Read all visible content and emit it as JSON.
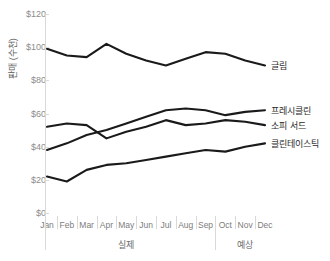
{
  "chart_data": {
    "type": "line",
    "title": "",
    "xlabel": "",
    "ylabel": "판매 (수천)",
    "ylim": [
      0,
      120
    ],
    "ytick_labels": [
      "$0",
      "$20",
      "$40",
      "$60",
      "$80",
      "$100",
      "$120"
    ],
    "ytick_values": [
      0,
      20,
      40,
      60,
      80,
      100,
      120
    ],
    "grid": false,
    "legend_position": "right-inline",
    "categories": [
      "Jan",
      "Feb",
      "Mar",
      "Apr",
      "May",
      "Jun",
      "Jul",
      "Aug",
      "Sep",
      "Oct",
      "Nov",
      "Dec"
    ],
    "group_labels": [
      "실제",
      "예상"
    ],
    "group_spans": [
      [
        "Jan",
        "Sep"
      ],
      [
        "Oct",
        "Dec"
      ]
    ],
    "series": [
      {
        "name": "글림",
        "values": [
          99,
          95,
          94,
          102,
          96,
          92,
          89,
          93,
          97,
          96,
          92,
          89
        ]
      },
      {
        "name": "프레시클린",
        "values": [
          38,
          42,
          47,
          50,
          54,
          58,
          62,
          63,
          62,
          59,
          61,
          62
        ]
      },
      {
        "name": "소피 서드",
        "values": [
          52,
          54,
          53,
          45,
          49,
          52,
          56,
          53,
          54,
          56,
          55,
          53
        ]
      },
      {
        "name": "클린테이스틱",
        "values": [
          22,
          19,
          26,
          29,
          30,
          32,
          34,
          36,
          38,
          37,
          40,
          42
        ]
      }
    ]
  }
}
